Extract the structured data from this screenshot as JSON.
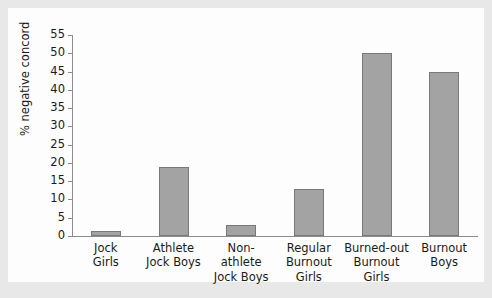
{
  "chart_data": {
    "type": "bar",
    "title": "",
    "xlabel": "",
    "ylabel": "% negative concord",
    "ylim": [
      0,
      55
    ],
    "ytick_step": 5,
    "yticks": [
      0,
      5,
      10,
      15,
      20,
      25,
      30,
      35,
      40,
      45,
      50,
      55
    ],
    "grid": false,
    "legend": null,
    "categories": [
      "Jock Girls",
      "Athlete Jock Boys",
      "Non-athlete Jock Boys",
      "Regular Burnout Girls",
      "Burned-out Burnout Girls",
      "Burnout Boys"
    ],
    "category_lines": [
      [
        "Jock",
        "Girls"
      ],
      [
        "Athlete",
        "Jock Boys"
      ],
      [
        "Non-athlete",
        "Jock Boys"
      ],
      [
        "Regular",
        "Burnout",
        "Girls"
      ],
      [
        "Burned-out",
        "Burnout",
        "Girls"
      ],
      [
        "Burnout",
        "Boys"
      ]
    ],
    "values": [
      1.5,
      19,
      3,
      13,
      50,
      45
    ],
    "bar_color": "#a3a3a3",
    "bar_edge_color": "#787878",
    "axis_color": "#8c8c8c",
    "plot_background": "#fdfdfd",
    "figure_background": "#e8e8e8"
  }
}
